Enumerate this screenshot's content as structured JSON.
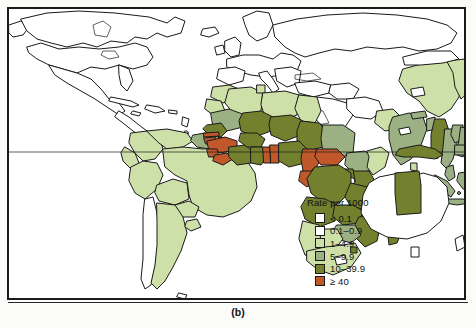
{
  "figure": {
    "caption": "(b)",
    "frame": true
  },
  "legend": {
    "title": "Rate per 1000",
    "items": [
      {
        "label": "< 0.1",
        "color": "#ffffff",
        "name": "legend-lt-0-1"
      },
      {
        "label": "0.1–0.9",
        "color": "#ffffff",
        "name": "legend-0-1-0-9"
      },
      {
        "label": "1–4.9",
        "color": "#cde0a8",
        "name": "legend-1-4-9"
      },
      {
        "label": "5–9.9",
        "color": "#9bb183",
        "name": "legend-5-9-9"
      },
      {
        "label": "10–39.9",
        "color": "#73812f",
        "name": "legend-10-39-9"
      },
      {
        "label": "≥ 40",
        "color": "#c1582a",
        "name": "legend-ge-40"
      }
    ]
  },
  "chart_data": {
    "type": "map",
    "title": "Rate per 1000",
    "projection": "world-equirectangular",
    "grid": false,
    "equator_line": true,
    "legend_position": "inside-lower-right",
    "categories": [
      "< 0.1",
      "0.1–0.9",
      "1–4.9",
      "5–9.9",
      "10–39.9",
      "≥ 40"
    ],
    "colors": [
      "#ffffff",
      "#ffffff",
      "#cde0a8",
      "#9bb183",
      "#73812f",
      "#c1582a"
    ],
    "regions": [
      {
        "name": "Canada",
        "class": "< 0.1"
      },
      {
        "name": "United States",
        "class": "< 0.1"
      },
      {
        "name": "Greenland",
        "class": "< 0.1"
      },
      {
        "name": "Mexico",
        "class": "< 0.1"
      },
      {
        "name": "Central America",
        "class": "< 0.1"
      },
      {
        "name": "Cuba",
        "class": "< 0.1"
      },
      {
        "name": "Hispaniola",
        "class": "< 0.1"
      },
      {
        "name": "Colombia",
        "class": "1–4.9"
      },
      {
        "name": "Venezuela",
        "class": "1–4.9"
      },
      {
        "name": "Guyana",
        "class": "5–9.9"
      },
      {
        "name": "Suriname",
        "class": "5–9.9"
      },
      {
        "name": "Ecuador",
        "class": "1–4.9"
      },
      {
        "name": "Peru",
        "class": "1–4.9"
      },
      {
        "name": "Bolivia",
        "class": "1–4.9"
      },
      {
        "name": "Brazil",
        "class": "1–4.9"
      },
      {
        "name": "Paraguay",
        "class": "1–4.9"
      },
      {
        "name": "Chile",
        "class": "< 0.1"
      },
      {
        "name": "Argentina",
        "class": "1–4.9"
      },
      {
        "name": "Uruguay",
        "class": "1–4.9"
      },
      {
        "name": "Western Europe",
        "class": "< 0.1"
      },
      {
        "name": "Eastern Europe",
        "class": "< 0.1"
      },
      {
        "name": "Russia",
        "class": "< 0.1"
      },
      {
        "name": "Turkey",
        "class": "< 0.1"
      },
      {
        "name": "Middle East",
        "class": "< 0.1"
      },
      {
        "name": "Morocco",
        "class": "1–4.9"
      },
      {
        "name": "Algeria",
        "class": "1–4.9"
      },
      {
        "name": "Tunisia",
        "class": "1–4.9"
      },
      {
        "name": "Libya",
        "class": "1–4.9"
      },
      {
        "name": "Egypt",
        "class": "1–4.9"
      },
      {
        "name": "Mauritania",
        "class": "5–9.9"
      },
      {
        "name": "Mali",
        "class": "10–39.9"
      },
      {
        "name": "Niger",
        "class": "10–39.9"
      },
      {
        "name": "Chad",
        "class": "10–39.9"
      },
      {
        "name": "Sudan",
        "class": "5–9.9"
      },
      {
        "name": "Senegal",
        "class": "10–39.9"
      },
      {
        "name": "Gambia",
        "class": "≥ 40"
      },
      {
        "name": "Guinea-Bissau",
        "class": "≥ 40"
      },
      {
        "name": "Guinea",
        "class": "≥ 40"
      },
      {
        "name": "Sierra Leone",
        "class": "≥ 40"
      },
      {
        "name": "Liberia",
        "class": "≥ 40"
      },
      {
        "name": "Côte d'Ivoire",
        "class": "10–39.9"
      },
      {
        "name": "Ghana",
        "class": "10–39.9"
      },
      {
        "name": "Togo",
        "class": "≥ 40"
      },
      {
        "name": "Benin",
        "class": "≥ 40"
      },
      {
        "name": "Burkina Faso",
        "class": "10–39.9"
      },
      {
        "name": "Nigeria",
        "class": "10–39.9"
      },
      {
        "name": "Cameroon",
        "class": "≥ 40"
      },
      {
        "name": "Central African Republic",
        "class": "≥ 40"
      },
      {
        "name": "Ethiopia",
        "class": "5–9.9"
      },
      {
        "name": "Somalia",
        "class": "1–4.9"
      },
      {
        "name": "Kenya",
        "class": "10–39.9"
      },
      {
        "name": "Uganda",
        "class": "10–39.9"
      },
      {
        "name": "Tanzania",
        "class": "10–39.9"
      },
      {
        "name": "Gabon",
        "class": "≥ 40"
      },
      {
        "name": "Congo",
        "class": "10–39.9"
      },
      {
        "name": "Zaire",
        "class": "10–39.9"
      },
      {
        "name": "Angola",
        "class": "10–39.9"
      },
      {
        "name": "Zambia",
        "class": "10–39.9"
      },
      {
        "name": "Malawi",
        "class": "≥ 40"
      },
      {
        "name": "Mozambique",
        "class": "10–39.9"
      },
      {
        "name": "Zimbabwe",
        "class": "5–9.9"
      },
      {
        "name": "Botswana",
        "class": "1–4.9"
      },
      {
        "name": "Namibia",
        "class": "1–4.9"
      },
      {
        "name": "South Africa",
        "class": "1–4.9"
      },
      {
        "name": "Lesotho",
        "class": "< 0.1"
      },
      {
        "name": "Madagascar",
        "class": "10–39.9"
      },
      {
        "name": "India",
        "class": "5–9.9"
      },
      {
        "name": "Pakistan",
        "class": "1–4.9"
      },
      {
        "name": "Nepal",
        "class": "5–9.9"
      },
      {
        "name": "Bangladesh",
        "class": "5–9.9"
      },
      {
        "name": "Sri Lanka",
        "class": "1–4.9"
      },
      {
        "name": "China",
        "class": "1–4.9"
      },
      {
        "name": "Mongolia",
        "class": "< 0.1"
      },
      {
        "name": "Japan",
        "class": "< 0.1"
      },
      {
        "name": "Korea",
        "class": "< 0.1"
      },
      {
        "name": "Myanmar",
        "class": "10–39.9"
      },
      {
        "name": "Thailand",
        "class": "5–9.9"
      },
      {
        "name": "Laos",
        "class": "5–9.9"
      },
      {
        "name": "Vietnam",
        "class": "5–9.9"
      },
      {
        "name": "Cambodia",
        "class": "5–9.9"
      },
      {
        "name": "Malaysia",
        "class": "5–9.9"
      },
      {
        "name": "Indonesia",
        "class": "5–9.9"
      },
      {
        "name": "Philippines",
        "class": "1–4.9"
      },
      {
        "name": "Papua New Guinea",
        "class": "10–39.9"
      },
      {
        "name": "Australia (Northern Territory)",
        "class": "10–39.9"
      },
      {
        "name": "Australia (other)",
        "class": "< 0.1"
      },
      {
        "name": "New Zealand",
        "class": "< 0.1"
      }
    ]
  }
}
